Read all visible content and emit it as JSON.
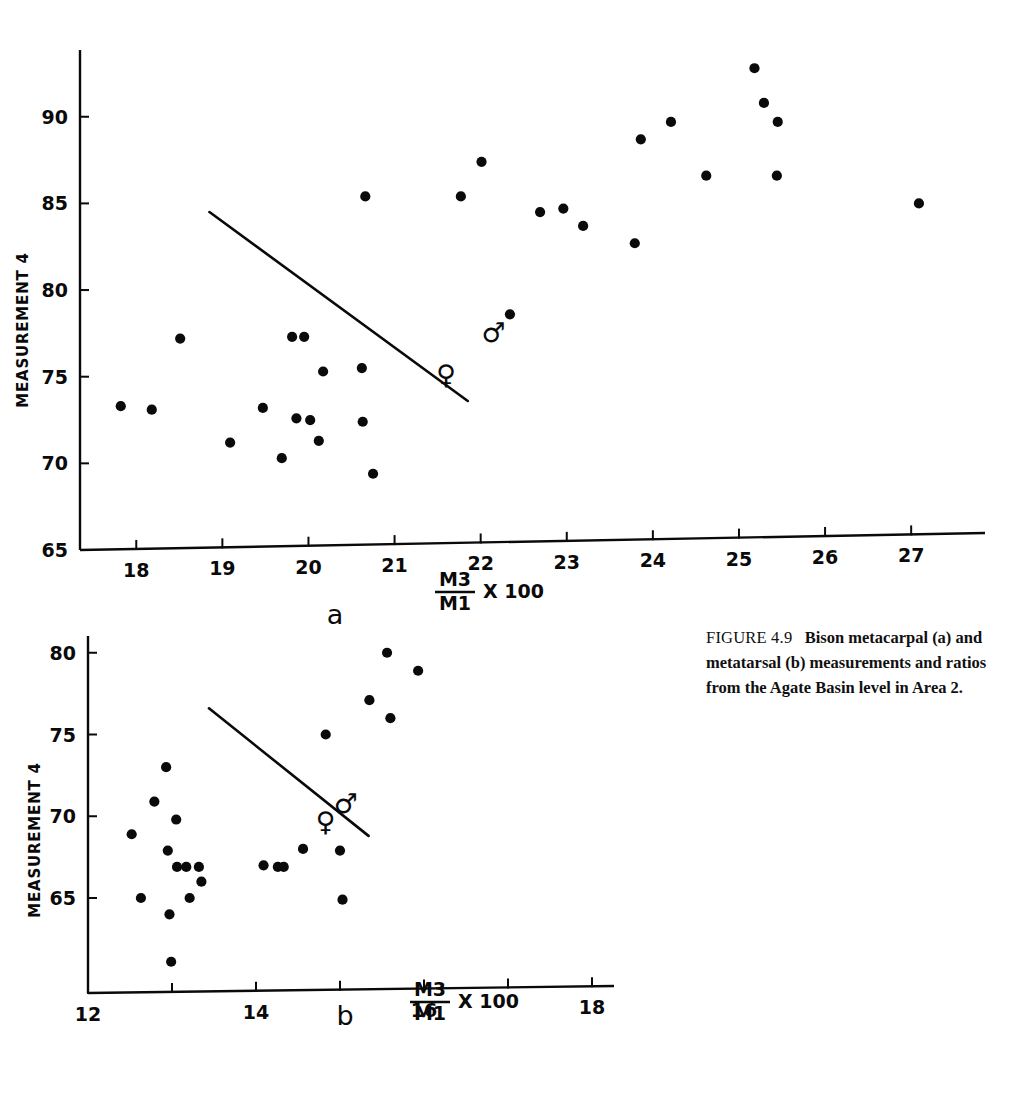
{
  "figure": {
    "caption_label": "FIGURE 4.9",
    "caption_text": "Bison metacarpal (a) and metatarsal (b) measurements and ratios from the Agate Basin level in Area 2.",
    "ink_color": "#0a0a0a",
    "background_color": "#ffffff"
  },
  "chart_data": [
    {
      "type": "scatter",
      "panel": "a",
      "panel_letter": "a",
      "title": "Bison metacarpal measurements and ratios",
      "xlabel": "M3/M1 X 100",
      "xlabel_numerator": "M3",
      "xlabel_denominator": "M1",
      "xlabel_suffix": "X 100",
      "ylabel": "MEASUREMENT 4",
      "xlim": [
        17.3,
        27.6
      ],
      "ylim": [
        65,
        93.5
      ],
      "xticks": [
        18,
        19,
        20,
        21,
        22,
        23,
        24,
        25,
        26,
        27
      ],
      "yticks": [
        65,
        70,
        75,
        80,
        85,
        90
      ],
      "grid": false,
      "legend": [
        "male",
        "female"
      ],
      "annotations": [
        {
          "symbol": "♂",
          "name": "male-symbol",
          "x": 22.15,
          "y": 77.0
        },
        {
          "symbol": "♀",
          "name": "female-symbol",
          "x": 21.6,
          "y": 74.6
        }
      ],
      "divider_line": {
        "x1": 18.85,
        "y1": 84.5,
        "x2": 21.85,
        "y2": 73.6
      },
      "points": [
        {
          "x": 17.82,
          "y": 73.3,
          "group": "female"
        },
        {
          "x": 18.18,
          "y": 73.1,
          "group": "female"
        },
        {
          "x": 18.51,
          "y": 77.2,
          "group": "female"
        },
        {
          "x": 19.09,
          "y": 71.2,
          "group": "female"
        },
        {
          "x": 19.47,
          "y": 73.2,
          "group": "female"
        },
        {
          "x": 19.69,
          "y": 70.3,
          "group": "female"
        },
        {
          "x": 19.81,
          "y": 77.3,
          "group": "female"
        },
        {
          "x": 19.95,
          "y": 77.3,
          "group": "female"
        },
        {
          "x": 19.86,
          "y": 72.6,
          "group": "female"
        },
        {
          "x": 20.02,
          "y": 72.5,
          "group": "female"
        },
        {
          "x": 20.17,
          "y": 75.3,
          "group": "female"
        },
        {
          "x": 20.12,
          "y": 71.3,
          "group": "female"
        },
        {
          "x": 20.62,
          "y": 75.5,
          "group": "female"
        },
        {
          "x": 20.63,
          "y": 72.4,
          "group": "female"
        },
        {
          "x": 20.66,
          "y": 85.4,
          "group": "male"
        },
        {
          "x": 20.75,
          "y": 69.4,
          "group": "female"
        },
        {
          "x": 21.77,
          "y": 85.4,
          "group": "male"
        },
        {
          "x": 22.01,
          "y": 87.4,
          "group": "male"
        },
        {
          "x": 22.34,
          "y": 78.6,
          "group": "male"
        },
        {
          "x": 22.69,
          "y": 84.5,
          "group": "male"
        },
        {
          "x": 22.96,
          "y": 84.7,
          "group": "male"
        },
        {
          "x": 23.19,
          "y": 83.7,
          "group": "male"
        },
        {
          "x": 23.79,
          "y": 82.7,
          "group": "male"
        },
        {
          "x": 23.86,
          "y": 88.7,
          "group": "male"
        },
        {
          "x": 24.21,
          "y": 89.7,
          "group": "male"
        },
        {
          "x": 24.62,
          "y": 86.6,
          "group": "male"
        },
        {
          "x": 25.18,
          "y": 92.8,
          "group": "male"
        },
        {
          "x": 25.29,
          "y": 90.8,
          "group": "male"
        },
        {
          "x": 25.45,
          "y": 89.7,
          "group": "male"
        },
        {
          "x": 25.44,
          "y": 86.6,
          "group": "male"
        },
        {
          "x": 27.09,
          "y": 85.0,
          "group": "male"
        }
      ]
    },
    {
      "type": "scatter",
      "panel": "b",
      "panel_letter": "b",
      "title": "Bison metatarsal measurements and ratios",
      "xlabel": "M3/M1 X 100",
      "xlabel_numerator": "M3",
      "xlabel_denominator": "M1",
      "xlabel_suffix": "X 100",
      "ylabel": "MEASUREMENT 4",
      "xlim": [
        12,
        19.2
      ],
      "ylim": [
        60.5,
        81.5
      ],
      "xticks": [
        12,
        13,
        14,
        15,
        16,
        17,
        18
      ],
      "xtick_labels": [
        "12",
        "",
        "14",
        "",
        "16",
        "",
        "18"
      ],
      "yticks": [
        65,
        70,
        75,
        80
      ],
      "grid": false,
      "legend": [
        "male",
        "female"
      ],
      "annotations": [
        {
          "symbol": "♂",
          "name": "male-symbol",
          "x": 15.07,
          "y": 70.2
        },
        {
          "symbol": "♀",
          "name": "female-symbol",
          "x": 14.83,
          "y": 69.1
        }
      ],
      "divider_line": {
        "x1": 13.44,
        "y1": 76.6,
        "x2": 15.34,
        "y2": 68.8
      },
      "points": [
        {
          "x": 12.52,
          "y": 68.9,
          "group": "female"
        },
        {
          "x": 12.63,
          "y": 65.0,
          "group": "female"
        },
        {
          "x": 12.79,
          "y": 70.9,
          "group": "female"
        },
        {
          "x": 12.93,
          "y": 73.0,
          "group": "female"
        },
        {
          "x": 12.97,
          "y": 64.0,
          "group": "female"
        },
        {
          "x": 12.95,
          "y": 67.9,
          "group": "female"
        },
        {
          "x": 12.99,
          "y": 61.1,
          "group": "female"
        },
        {
          "x": 13.05,
          "y": 69.8,
          "group": "female"
        },
        {
          "x": 13.06,
          "y": 66.9,
          "group": "female"
        },
        {
          "x": 13.17,
          "y": 66.9,
          "group": "female"
        },
        {
          "x": 13.21,
          "y": 65.0,
          "group": "female"
        },
        {
          "x": 13.32,
          "y": 66.9,
          "group": "female"
        },
        {
          "x": 13.35,
          "y": 66.0,
          "group": "female"
        },
        {
          "x": 14.09,
          "y": 67.0,
          "group": "female"
        },
        {
          "x": 14.26,
          "y": 66.9,
          "group": "female"
        },
        {
          "x": 14.33,
          "y": 66.9,
          "group": "female"
        },
        {
          "x": 14.56,
          "y": 68.0,
          "group": "female"
        },
        {
          "x": 14.83,
          "y": 75.0,
          "group": "male"
        },
        {
          "x": 15.0,
          "y": 67.9,
          "group": "female"
        },
        {
          "x": 15.03,
          "y": 64.9,
          "group": "female"
        },
        {
          "x": 15.35,
          "y": 77.1,
          "group": "male"
        },
        {
          "x": 15.56,
          "y": 80.0,
          "group": "male"
        },
        {
          "x": 15.6,
          "y": 76.0,
          "group": "male"
        },
        {
          "x": 15.93,
          "y": 78.9,
          "group": "male"
        }
      ]
    }
  ]
}
